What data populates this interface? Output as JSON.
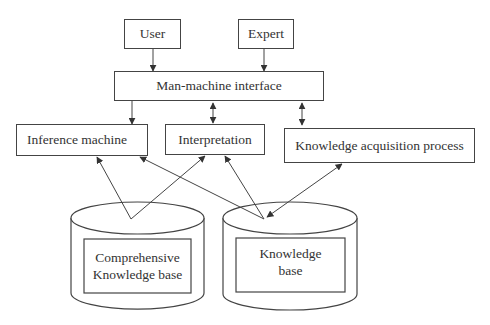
{
  "diagram": {
    "type": "block-diagram",
    "nodes": {
      "user": {
        "label": "User"
      },
      "expert": {
        "label": "Expert"
      },
      "interface": {
        "label": "Man-machine interface"
      },
      "inference": {
        "label": "Inference machine"
      },
      "interpretation": {
        "label": "Interpretation"
      },
      "acquisition": {
        "label": "Knowledge acquisition process"
      },
      "comprehensive_kb": {
        "label_line1": "Comprehensive",
        "label_line2": "Knowledge base"
      },
      "kb": {
        "label_line1": "Knowledge",
        "label_line2": "base"
      }
    },
    "edges": [
      {
        "from": "User",
        "to": "Man-machine interface",
        "direction": "one-way"
      },
      {
        "from": "Expert",
        "to": "Man-machine interface",
        "direction": "one-way"
      },
      {
        "from": "Man-machine interface",
        "to": "Inference machine",
        "direction": "one-way"
      },
      {
        "from": "Man-machine interface",
        "to": "Interpretation",
        "direction": "two-way"
      },
      {
        "from": "Man-machine interface",
        "to": "Knowledge acquisition process",
        "direction": "two-way"
      },
      {
        "from": "Comprehensive Knowledge base",
        "to": "Inference machine",
        "direction": "one-way"
      },
      {
        "from": "Comprehensive Knowledge base",
        "to": "Interpretation",
        "direction": "one-way"
      },
      {
        "from": "Knowledge base",
        "to": "Inference machine",
        "direction": "one-way"
      },
      {
        "from": "Knowledge base",
        "to": "Interpretation",
        "direction": "one-way"
      },
      {
        "from": "Knowledge acquisition process",
        "to": "Knowledge base",
        "direction": "two-way"
      }
    ],
    "colors": {
      "line": "#444444",
      "text": "#333333",
      "background": "#ffffff"
    }
  }
}
